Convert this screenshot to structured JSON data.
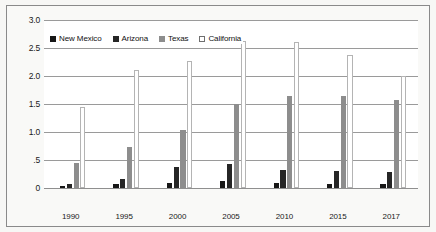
{
  "chart_data": {
    "type": "bar",
    "title": "",
    "xlabel": "",
    "ylabel": "",
    "categories": [
      "1990",
      "1995",
      "2000",
      "2005",
      "2010",
      "2015",
      "2017"
    ],
    "series": [
      {
        "name": "New Mexico",
        "color": "#171717",
        "values": [
          0.04,
          0.07,
          0.09,
          0.12,
          0.09,
          0.08,
          0.07
        ]
      },
      {
        "name": "Arizona",
        "color": "#262626",
        "values": [
          0.07,
          0.16,
          0.38,
          0.42,
          0.33,
          0.3,
          0.29
        ]
      },
      {
        "name": "Texas",
        "color": "#8d8d8d",
        "values": [
          0.45,
          0.73,
          1.03,
          1.5,
          1.65,
          1.65,
          1.57
        ]
      },
      {
        "name": "California",
        "color": "#ffffff",
        "values": [
          1.45,
          2.1,
          2.27,
          2.62,
          2.6,
          2.38,
          2.0
        ]
      }
    ],
    "ylim": [
      0,
      3.0
    ],
    "ytick_values": [
      0,
      0.5,
      1.0,
      1.5,
      2.0,
      2.5,
      3.0
    ],
    "ytick_labels": [
      "0",
      ".5",
      "1.0",
      "1.5",
      "2.0",
      "2.5",
      "3.0"
    ],
    "grid": true,
    "legend_position": "top-left-inside"
  }
}
